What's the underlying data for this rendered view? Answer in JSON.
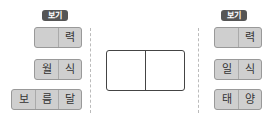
{
  "left": {
    "badge": "보기",
    "rows": [
      [
        "",
        "력"
      ],
      [
        "월",
        "식"
      ],
      [
        "보",
        "름",
        "달"
      ]
    ]
  },
  "right": {
    "badge": "보기",
    "rows": [
      [
        "",
        "력"
      ],
      [
        "일",
        "식"
      ],
      [
        "태",
        "양"
      ]
    ]
  },
  "answer_box": {
    "cells": [
      "",
      ""
    ]
  }
}
